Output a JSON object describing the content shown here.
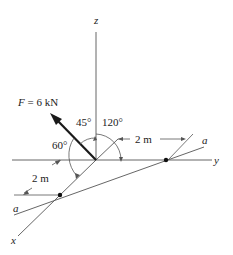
{
  "diagram": {
    "axes": {
      "z_label": "z",
      "y_label": "y",
      "x_label": "x"
    },
    "force": {
      "label": "F = 6 kN",
      "name": "F",
      "magnitude": "6 kN"
    },
    "angles": {
      "with_z": "45°",
      "with_y": "120°",
      "with_x": "60°"
    },
    "dimensions": {
      "along_y": "2 m",
      "along_x": "2 m"
    },
    "line": {
      "label_start": "a",
      "label_end": "a"
    },
    "colors": {
      "line": "#555555",
      "force": "#1a1a1a",
      "text": "#222222"
    }
  }
}
